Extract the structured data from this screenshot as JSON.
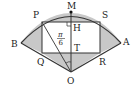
{
  "diagram": {
    "points": {
      "M": {
        "label": "M",
        "x": 71,
        "y": 12
      },
      "P": {
        "label": "P",
        "x": 42,
        "y": 22
      },
      "S": {
        "label": "S",
        "x": 100,
        "y": 22
      },
      "B": {
        "label": "B",
        "x": 21,
        "y": 43
      },
      "A": {
        "label": "A",
        "x": 121,
        "y": 43
      },
      "Q": {
        "label": "Q",
        "x": 42,
        "y": 53
      },
      "R": {
        "label": "R",
        "x": 100,
        "y": 53
      },
      "O": {
        "label": "O",
        "x": 71,
        "y": 72
      },
      "T": {
        "label": "T",
        "x": 71,
        "y": 53
      },
      "H": {
        "label": "H",
        "x": 71,
        "y": 22
      }
    },
    "angle_label": {
      "numerator": "π",
      "denominator": "6"
    },
    "colors": {
      "shade": "#c8c8c8",
      "line": "#333333",
      "background": "#ffffff"
    }
  }
}
